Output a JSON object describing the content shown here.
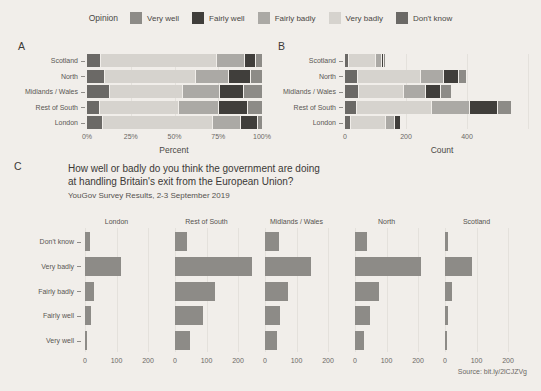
{
  "colors": {
    "background": "#f1eeea",
    "facet_bar": "#8d8b87",
    "gridline": "#e4e1dc",
    "text": "#3b3936"
  },
  "legend": {
    "title": "Opinion",
    "items": [
      {
        "label": "Very well",
        "color": "#8d8b87"
      },
      {
        "label": "Fairly well",
        "color": "#403e3b"
      },
      {
        "label": "Fairly badly",
        "color": "#aba9a5"
      },
      {
        "label": "Very badly",
        "color": "#d6d3ce"
      },
      {
        "label": "Don't know",
        "color": "#6b6966"
      }
    ]
  },
  "chart_data": [
    {
      "id": "panel-a",
      "panel_label": "A",
      "type": "bar",
      "orientation": "horizontal",
      "stacked": true,
      "unit": "percent",
      "categories": [
        "Scotland",
        "North",
        "Midlands / Wales",
        "Rest of South",
        "London"
      ],
      "series": [
        {
          "name": "Don't know",
          "values": [
            7.6,
            9.5,
            12.6,
            6.8,
            8.7
          ]
        },
        {
          "name": "Very badly",
          "values": [
            66.4,
            52.3,
            41.7,
            45.0,
            62.5
          ]
        },
        {
          "name": "Fairly badly",
          "values": [
            16.0,
            18.8,
            21.0,
            23.1,
            16.3
          ]
        },
        {
          "name": "Fairly well",
          "values": [
            6.1,
            12.3,
            14.1,
            16.5,
            9.8
          ]
        },
        {
          "name": "Very well",
          "values": [
            3.8,
            7.0,
            10.6,
            8.6,
            2.7
          ]
        }
      ],
      "xlabel": "Percent",
      "x_ticks": [
        "0%",
        "25%",
        "50%",
        "75%",
        "100%"
      ],
      "xlim": [
        0,
        100
      ],
      "grid": false,
      "legend_position": "top"
    },
    {
      "id": "panel-b",
      "panel_label": "B",
      "type": "bar",
      "orientation": "horizontal",
      "stacked": true,
      "unit": "count",
      "categories": [
        "Scotland",
        "North",
        "Midlands / Wales",
        "Rest of South",
        "London"
      ],
      "series": [
        {
          "name": "Don't know",
          "values": [
            10,
            38,
            44,
            37,
            16
          ]
        },
        {
          "name": "Very badly",
          "values": [
            87,
            208,
            145,
            245,
            115
          ]
        },
        {
          "name": "Fairly badly",
          "values": [
            21,
            75,
            73,
            126,
            30
          ]
        },
        {
          "name": "Fairly well",
          "values": [
            8,
            49,
            49,
            90,
            18
          ]
        },
        {
          "name": "Very well",
          "values": [
            5,
            28,
            37,
            47,
            5
          ]
        }
      ],
      "xlabel": "Count",
      "x_ticks": [
        "0",
        "200",
        "400"
      ],
      "x_tick_values": [
        0,
        200,
        400
      ],
      "xlim": [
        0,
        640
      ],
      "grid": true,
      "legend_position": "top"
    },
    {
      "id": "panel-c",
      "panel_label": "C",
      "type": "bar",
      "orientation": "horizontal",
      "faceted": true,
      "unit": "count",
      "title_lines": [
        "How well or badly do you think the government are doing",
        "at handling Britain's exit from the European Union?"
      ],
      "subtitle": "YouGov Survey Results, 2-3 September 2019",
      "source": "Source: bit.ly/2lCJZVg",
      "facets": [
        "London",
        "Rest of South",
        "Midlands / Wales",
        "North",
        "Scotland"
      ],
      "categories": [
        "Don't know",
        "Very badly",
        "Fairly badly",
        "Fairly well",
        "Very well"
      ],
      "values_by_facet": {
        "London": [
          16,
          115,
          30,
          18,
          5
        ],
        "Rest of South": [
          37,
          245,
          126,
          90,
          47
        ],
        "Midlands / Wales": [
          44,
          145,
          73,
          49,
          37
        ],
        "North": [
          38,
          208,
          75,
          49,
          28
        ],
        "Scotland": [
          10,
          87,
          21,
          8,
          5
        ]
      },
      "x_ticks": [
        "0",
        "100",
        "200"
      ],
      "x_tick_values": [
        0,
        100,
        200
      ],
      "xlim": [
        0,
        240
      ],
      "grid": true
    }
  ]
}
